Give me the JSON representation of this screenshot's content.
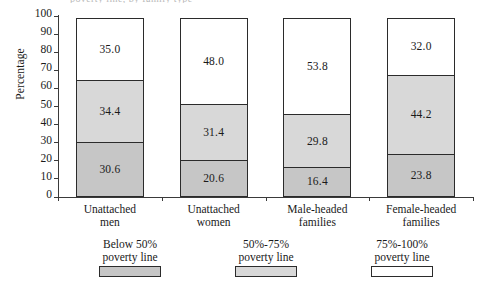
{
  "caption_sliver": "poverty line, by family type",
  "chart_data": {
    "type": "bar",
    "subtype": "stacked-vertical-100",
    "title": "",
    "xlabel": "",
    "ylabel": "Percentage",
    "ylim": [
      0,
      100
    ],
    "yticks": [
      0,
      10,
      20,
      30,
      40,
      50,
      60,
      70,
      80,
      90,
      100
    ],
    "grid": false,
    "legend_position": "bottom",
    "categories": [
      "Unattached\nmen",
      "Unattached\nwomen",
      "Male-headed\nfamilies",
      "Female-headed\nfamilies"
    ],
    "series": [
      {
        "name": "Below 50%\npoverty line",
        "color": "#c6c6c6",
        "values": [
          30.6,
          20.6,
          16.4,
          23.8
        ],
        "labels": [
          "30.6",
          "20.6",
          "16.4",
          "23.8"
        ]
      },
      {
        "name": "50%-75%\npoverty line",
        "color": "#d8d8d8",
        "values": [
          34.4,
          31.4,
          29.8,
          44.2
        ],
        "labels": [
          "34.4",
          "31.4",
          "29.8",
          "44.2"
        ]
      },
      {
        "name": "75%-100%\npoverty line",
        "color": "#ffffff",
        "values": [
          35.0,
          48.0,
          53.8,
          32.0
        ],
        "labels": [
          "35.0",
          "48.0",
          "53.8",
          "32.0"
        ]
      }
    ]
  },
  "colors": {
    "axis": "#3a3a3a",
    "border": "#2b2b2b",
    "text": "#1a1a1a",
    "background": "#ffffff"
  }
}
